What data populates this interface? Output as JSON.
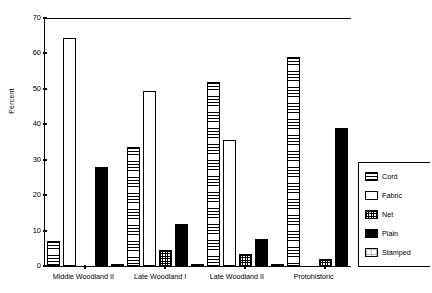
{
  "chart_data": {
    "type": "bar",
    "title": "",
    "xlabel": "",
    "ylabel": "Percent",
    "ylim": [
      0,
      70
    ],
    "yticks": [
      0,
      10,
      20,
      30,
      40,
      50,
      60,
      70
    ],
    "grid": false,
    "legend_position": "right",
    "categories": [
      "Middle Woodland II",
      "Late Woodland I",
      "Late Woodland II",
      "Protohistoric"
    ],
    "series": [
      {
        "name": "Cord",
        "pattern": "horizontal-lines",
        "values": [
          7.0,
          33.5,
          52.0,
          59.0
        ]
      },
      {
        "name": "Fabric",
        "pattern": "empty",
        "values": [
          64.5,
          49.5,
          35.5,
          0.0
        ]
      },
      {
        "name": "Net",
        "pattern": "crosshatch",
        "values": [
          0.0,
          4.5,
          3.5,
          2.0
        ]
      },
      {
        "name": "Plain",
        "pattern": "solid-black",
        "values": [
          28.0,
          12.0,
          7.5,
          39.0
        ]
      },
      {
        "name": "Stamped",
        "pattern": "light-dots",
        "values": [
          0.4,
          0.4,
          0.5,
          0.0
        ]
      }
    ]
  },
  "legend": {
    "entries": [
      {
        "label": "Cord"
      },
      {
        "label": "Fabric"
      },
      {
        "label": "Net"
      },
      {
        "label": "Plain"
      },
      {
        "label": "Stamped"
      }
    ]
  },
  "colors": {
    "axis": "#000000",
    "plain_fill": "#000000",
    "background": "#ffffff"
  }
}
